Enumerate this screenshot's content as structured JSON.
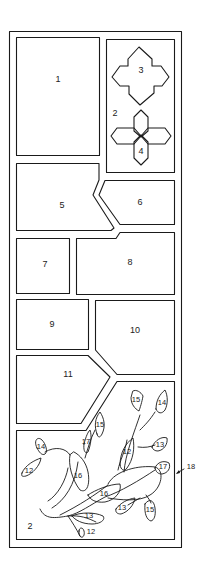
{
  "diagram": {
    "colors": {
      "line": "#1a1a1a",
      "background": "#ffffff"
    },
    "panels": [
      {
        "id": "panel-1",
        "label": "1"
      },
      {
        "id": "panel-2-top",
        "label": "2"
      },
      {
        "id": "shape-3",
        "label": "3"
      },
      {
        "id": "shape-4",
        "label": "4"
      },
      {
        "id": "panel-5",
        "label": "5"
      },
      {
        "id": "panel-6",
        "label": "6"
      },
      {
        "id": "panel-7",
        "label": "7"
      },
      {
        "id": "panel-8",
        "label": "8"
      },
      {
        "id": "panel-9",
        "label": "9"
      },
      {
        "id": "panel-10",
        "label": "10"
      },
      {
        "id": "panel-11",
        "label": "11"
      },
      {
        "id": "panel-2-bottom",
        "label": "2"
      }
    ],
    "leaves": [
      {
        "label": "14"
      },
      {
        "label": "12"
      },
      {
        "label": "17"
      },
      {
        "label": "15"
      },
      {
        "label": "16"
      },
      {
        "label": "16"
      },
      {
        "label": "13"
      },
      {
        "label": "12"
      },
      {
        "label": "15"
      },
      {
        "label": "14"
      },
      {
        "label": "12"
      },
      {
        "label": "13"
      },
      {
        "label": "17"
      },
      {
        "label": "13"
      },
      {
        "label": "15"
      }
    ],
    "callout": {
      "label": "18"
    }
  }
}
